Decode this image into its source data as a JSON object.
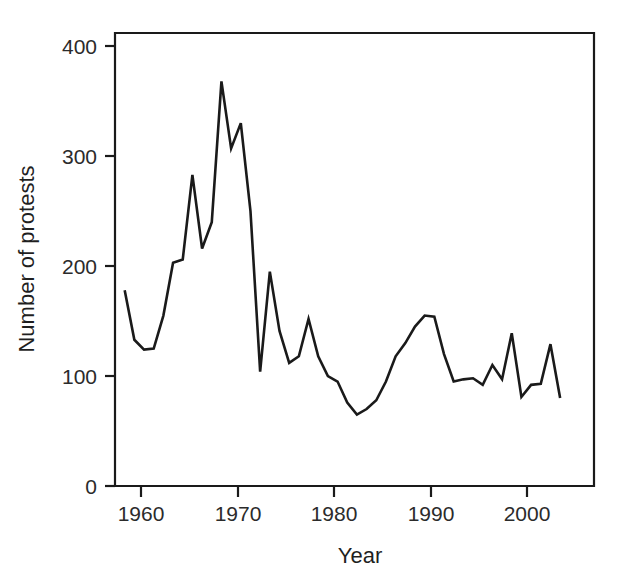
{
  "chart_data": {
    "type": "line",
    "title": "",
    "xlabel": "Year",
    "ylabel": "Number of protests",
    "xlim": [
      1959.0,
      2008.5
    ],
    "ylim": [
      0,
      412
    ],
    "grid": false,
    "legend": null,
    "line_color": "#1a1a1a",
    "xticks": [
      1960,
      1970,
      1980,
      1990,
      2000
    ],
    "xtick_labels": [
      "1960",
      "1970",
      "1980",
      "1990",
      "2000"
    ],
    "yticks": [
      0,
      100,
      200,
      300,
      400
    ],
    "ytick_labels": [
      "0",
      "100",
      "200",
      "300",
      "400"
    ],
    "x": [
      1960,
      1961,
      1962,
      1963,
      1964,
      1965,
      1966,
      1967,
      1968,
      1969,
      1970,
      1971,
      1972,
      1973,
      1974,
      1975,
      1976,
      1977,
      1978,
      1979,
      1980,
      1981,
      1982,
      1983,
      1984,
      1985,
      1986,
      1987,
      1988,
      1989,
      1990,
      1991,
      1992,
      1993,
      1994,
      1995,
      1996,
      1997,
      1998,
      1999,
      2000,
      2001,
      2002,
      2003,
      2004,
      2005
    ],
    "values": [
      178,
      133,
      124,
      125,
      155,
      203,
      206,
      283,
      216,
      240,
      368,
      307,
      330,
      250,
      104,
      195,
      141,
      112,
      118,
      152,
      118,
      100,
      95,
      76,
      65,
      70,
      78,
      95,
      118,
      130,
      145,
      155,
      154,
      120,
      95,
      97,
      98,
      92,
      110,
      97,
      139,
      81,
      92,
      93,
      129,
      80
    ],
    "series": [
      {
        "name": "Number of protests",
        "values": [
          178,
          133,
          124,
          125,
          155,
          203,
          206,
          283,
          216,
          240,
          368,
          307,
          330,
          250,
          104,
          195,
          141,
          112,
          118,
          152,
          118,
          100,
          95,
          76,
          65,
          70,
          78,
          95,
          118,
          130,
          145,
          155,
          154,
          120,
          95,
          97,
          98,
          92,
          110,
          97,
          139,
          81,
          92,
          93,
          129,
          80
        ]
      }
    ],
    "peak": {
      "year": 1970,
      "value": 368
    },
    "trough": {
      "year": 1984,
      "value": 65
    }
  },
  "axes": {
    "x_title": "Year",
    "y_title": "Number of protests"
  }
}
